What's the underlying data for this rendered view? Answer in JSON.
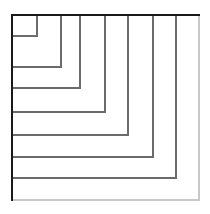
{
  "figure": {
    "canvas": {
      "width": 210,
      "height": 214,
      "background": "#ffffff"
    },
    "colors": {
      "outer_stroke": "#1a1a1a",
      "inner_stroke": "#6b6b6b",
      "edge_shadow": "#c8c8c8",
      "background": "#ffffff"
    },
    "geometry": {
      "origin_x": 12,
      "origin_y": 15,
      "outer_right": 199,
      "outer_bottom": 200
    },
    "outer_frame": {
      "label": "outer-rectangle",
      "x": 12,
      "y": 15,
      "right": 199,
      "bottom": 200,
      "stroke_width": 2.2
    },
    "nested_count": 8,
    "nested_paths": [
      {
        "label": "corner-path-1",
        "corner_x": 37,
        "corner_y": 36,
        "stroke_width": 1.1
      },
      {
        "label": "corner-path-2",
        "corner_x": 61,
        "corner_y": 67,
        "stroke_width": 1.1
      },
      {
        "label": "corner-path-3",
        "corner_x": 80,
        "corner_y": 88,
        "stroke_width": 1.1
      },
      {
        "label": "corner-path-4",
        "corner_x": 105,
        "corner_y": 112,
        "stroke_width": 1.1
      },
      {
        "label": "corner-path-5",
        "corner_x": 128,
        "corner_y": 135,
        "stroke_width": 1.1
      },
      {
        "label": "corner-path-6",
        "corner_x": 153,
        "corner_y": 157,
        "stroke_width": 1.1
      },
      {
        "label": "corner-path-7",
        "corner_x": 176,
        "corner_y": 178,
        "stroke_width": 1.1
      },
      {
        "label": "corner-path-8",
        "corner_x": 199,
        "corner_y": 200,
        "stroke_width": 1.1
      }
    ]
  }
}
